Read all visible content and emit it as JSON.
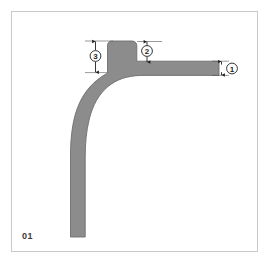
{
  "figure": {
    "plate_label": "01",
    "type": "technical-cross-section-drawing",
    "colors": {
      "profile_fill": "#8c8c8c",
      "profile_stroke": "#6e6e6e",
      "frame_border": "#c9c9c9",
      "background": "#ffffff",
      "dimension_line": "#1f1f1f",
      "label_text": "#3a3a3a"
    },
    "frame": {
      "x": 11,
      "y": 11,
      "width": 247,
      "height": 241
    }
  },
  "callouts": [
    {
      "id": "callout-1",
      "number": "1",
      "label": "①",
      "circle": {
        "cx": 232,
        "cy": 69,
        "r": 5.4
      },
      "dimension": {
        "orientation": "vertical",
        "x": 221,
        "y_top": 62,
        "y_bottom": 76,
        "measures": "horizontal-arm-thickness"
      }
    },
    {
      "id": "callout-2",
      "number": "2",
      "label": "②",
      "circle": {
        "cx": 147,
        "cy": 51,
        "r": 5.4
      },
      "dimension": {
        "orientation": "vertical",
        "x": 147,
        "y_top": 42,
        "y_bottom": 62,
        "measures": "rib-height-right"
      }
    },
    {
      "id": "callout-3",
      "number": "3",
      "label": "③",
      "circle": {
        "cx": 96,
        "cy": 56,
        "r": 5.4
      },
      "dimension": {
        "orientation": "vertical",
        "x": 96,
        "y_top": 41,
        "y_bottom": 72,
        "measures": "rib-height-left"
      }
    }
  ],
  "extension_lines": [
    {
      "id": "ext-top-left",
      "x1": 85,
      "y1": 41,
      "x2": 113,
      "y2": 41
    },
    {
      "id": "ext-bottom-left",
      "x1": 85,
      "y1": 72,
      "x2": 106,
      "y2": 72
    },
    {
      "id": "ext-top-right",
      "x1": 138,
      "y1": 42,
      "x2": 160,
      "y2": 42
    },
    {
      "id": "ext-arm-top",
      "x1": 214,
      "y1": 62,
      "x2": 228,
      "y2": 62
    },
    {
      "id": "ext-arm-bottom",
      "x1": 214,
      "y1": 76,
      "x2": 228,
      "y2": 76
    }
  ],
  "profile_geometry": {
    "outer_path": "M 71 236 L 71 152 C 71 112 84 86 104 74 L 108 72 L 108 45 C 108 42 110 41 113 41 L 132 41 C 135 41 137 42 137 45 L 137 61 L 219 61 L 219 75 L 140 75 C 120 76 106 85 97 101 C 90 114 87 131 86 152 L 86 236 Z",
    "note": "curved L-profile with raised rib near the corner and straight horizontal arm to the right"
  }
}
